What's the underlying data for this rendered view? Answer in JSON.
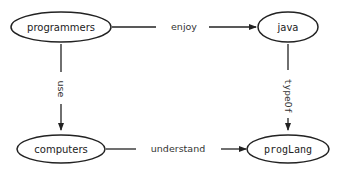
{
  "diagram": {
    "nodes": [
      {
        "id": "programmers",
        "label": "programmers",
        "monospace": false
      },
      {
        "id": "java",
        "label": "java",
        "monospace": false
      },
      {
        "id": "computers",
        "label": "computers",
        "monospace": false
      },
      {
        "id": "progLang",
        "label": "progLang",
        "monospace": true
      }
    ],
    "edges": [
      {
        "from": "programmers",
        "to": "java",
        "label": "enjoy",
        "direction": "horizontal"
      },
      {
        "from": "programmers",
        "to": "computers",
        "label": "use",
        "direction": "vertical"
      },
      {
        "from": "java",
        "to": "progLang",
        "label": "typeOf",
        "direction": "vertical"
      },
      {
        "from": "computers",
        "to": "progLang",
        "label": "understand",
        "direction": "horizontal"
      }
    ],
    "colors": {
      "stroke": "#222222",
      "background": "#ffffff"
    }
  }
}
